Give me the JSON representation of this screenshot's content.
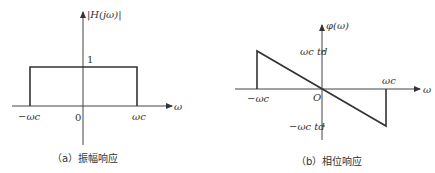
{
  "figure_a": {
    "caption": "（a）振幅响应",
    "y_label": "|H(jω)|",
    "x_label": "ω",
    "level_label": "1",
    "origin_label": "0",
    "neg_cutoff_label": "−ωc",
    "pos_cutoff_label": "ωc"
  },
  "figure_b": {
    "caption": "（b）相位响应",
    "y_label": "φ(ω)",
    "x_label": "ω",
    "origin_label": "O",
    "neg_cutoff_label": "−ωc",
    "pos_cutoff_label": "ωc",
    "pos_phase_label": "ωc td",
    "neg_phase_label": "−ωc td"
  },
  "colors": {
    "line": "#333333",
    "background": "#ffffff"
  }
}
